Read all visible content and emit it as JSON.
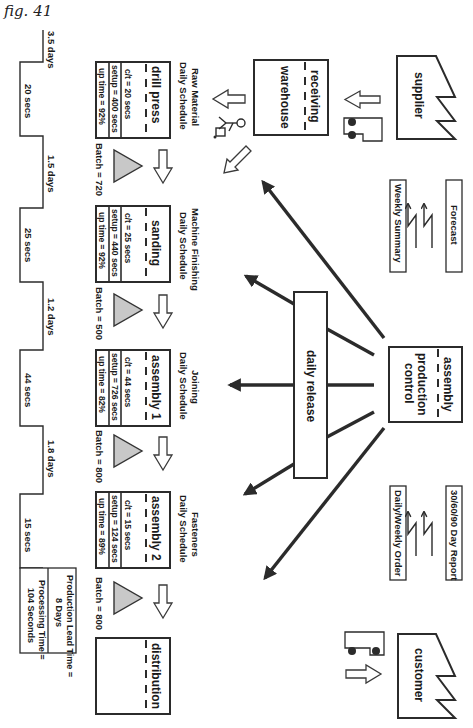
{
  "figure": {
    "label": "fig. 41"
  },
  "colors": {
    "ink": "#2b2b2b",
    "inventory_fill": "#c8c8c8",
    "background": "#ffffff"
  },
  "external": {
    "supplier": {
      "label": "supplier"
    },
    "customer": {
      "label": "customer"
    }
  },
  "receiving": {
    "line1": "receiving",
    "line2": "warehouse"
  },
  "control": {
    "line1": "assembly",
    "line2": "production",
    "line3": "control"
  },
  "daily_release": {
    "label": "daily release"
  },
  "info_flows": {
    "forecast": "Forecast",
    "weekly_summary": "Weekly Summary",
    "report": "30/60/90 Day Report",
    "order": "Daily/Weekly Order"
  },
  "processes": [
    {
      "name": "drill press",
      "schedule1": "Raw Material",
      "schedule2": "Daily Schedule",
      "ct": "c/t = 20 secs",
      "setup": "setup = 400 secs",
      "uptime": "up time = 92%"
    },
    {
      "name": "sanding",
      "schedule1": "Machine Finishing",
      "schedule2": "Daily Schedule",
      "ct": "c/t = 25 secs",
      "setup": "setup = 440 secs",
      "uptime": "up time = 92%"
    },
    {
      "name": "assembly 1",
      "schedule1": "Joining",
      "schedule2": "Daily Schedule",
      "ct": "c/t = 44 secs",
      "setup": "setup = 726 secs",
      "uptime": "up time = 82%"
    },
    {
      "name": "assembly 2",
      "schedule1": "Fasteners",
      "schedule2": "Daily Schedule",
      "ct": "c/t = 15 secs",
      "setup": "setup = 124 secs",
      "uptime": "up time = 89%"
    }
  ],
  "distribution": {
    "label": "distribution"
  },
  "inventory": [
    {
      "batch": "Batch = 720"
    },
    {
      "batch": "Batch = 500"
    },
    {
      "batch": "Batch = 800"
    },
    {
      "batch": "Batch = 800"
    }
  ],
  "timeline": {
    "days": [
      "3.5 days",
      "1.5 days",
      "1.2 days",
      "1.8 days"
    ],
    "secs": [
      "20 secs",
      "25 secs",
      "44 secs",
      "15 secs"
    ],
    "summary": {
      "lead1": "Production Lead Time =",
      "lead2": "8 Days",
      "proc1": "Processing Time =",
      "proc2": "104 Seconds"
    }
  }
}
